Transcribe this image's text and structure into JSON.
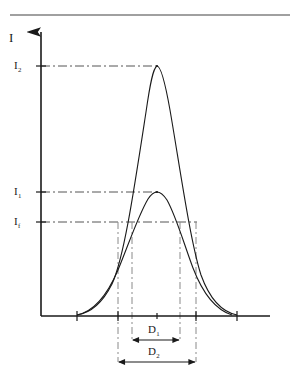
{
  "figure": {
    "background_color": "#ffffff",
    "ink_color": "#1a1a1a",
    "dash_color": "#555555",
    "top_rule": {
      "x1": 10,
      "x2": 290,
      "y": 15
    }
  },
  "axes": {
    "y_axis": {
      "label": "I",
      "x": 41,
      "y_top": 30,
      "y_bottom": 316,
      "arrow": "up-arrow"
    },
    "x_axis": {
      "label": "",
      "y": 316,
      "x_left": 41,
      "x_right": 270,
      "ticks_x": [
        77,
        118,
        157,
        196,
        237
      ]
    },
    "y_ticks": [
      {
        "label": "I",
        "sub": "2",
        "y": 66
      },
      {
        "label": "I",
        "sub": "1",
        "y": 192
      },
      {
        "label": "I",
        "sub": "f",
        "y": 222
      }
    ]
  },
  "reference_lines": {
    "horizontal": [
      {
        "name": "I2-level",
        "y": 66,
        "x1": 41,
        "x2": 157
      },
      {
        "name": "I1-level",
        "y": 192,
        "x1": 41,
        "x2": 157
      },
      {
        "name": "If-level",
        "y": 222,
        "x1": 41,
        "x2": 197
      }
    ],
    "vertical": [
      {
        "name": "D2-left",
        "x": 118,
        "y1": 222,
        "y2": 362
      },
      {
        "name": "D1-left",
        "x": 132,
        "y1": 222,
        "y2": 340
      },
      {
        "name": "D1-right",
        "x": 180,
        "y1": 222,
        "y2": 340
      },
      {
        "name": "D2-right",
        "x": 196,
        "y1": 222,
        "y2": 362
      }
    ]
  },
  "dimensions": [
    {
      "name": "D1",
      "label": "D",
      "sub": "1",
      "x1": 132,
      "x2": 180,
      "y": 340
    },
    {
      "name": "D2",
      "label": "D",
      "sub": "2",
      "x1": 118,
      "x2": 196,
      "y": 362
    }
  ],
  "chart_data": {
    "type": "line",
    "title": "",
    "xlabel": "",
    "ylabel": "I",
    "grid": false,
    "legend": null,
    "axis_pixel_frame": {
      "x0": 41,
      "x1": 270,
      "y_base": 316,
      "y_top": 30
    },
    "annotations": [
      {
        "text": "I",
        "sub": "2",
        "type": "y-tick",
        "value_y": 66
      },
      {
        "text": "I",
        "sub": "1",
        "type": "y-tick",
        "value_y": 192
      },
      {
        "text": "I",
        "sub": "f",
        "type": "y-tick",
        "value_y": 222
      },
      {
        "text": "D",
        "sub": "1",
        "type": "width-at-If-of-curve-1",
        "value_px": 48
      },
      {
        "text": "D",
        "sub": "2",
        "type": "width-at-If-of-curve-2",
        "value_px": 78
      }
    ],
    "series": [
      {
        "name": "curve-small-peak-I1",
        "peak_x": 157,
        "peak_y": 192,
        "width_at_If": 48,
        "path": "M 77,315 C 92,312 106,298 118,270 C 128,246 138,216 148,199 C 152,193 155,192 157,192 C 160,192 163,194 167,200 C 176,216 184,244 193,268 C 203,294 216,310 232,315"
      },
      {
        "name": "curve-large-peak-I2",
        "peak_x": 157,
        "peak_y": 66,
        "width_at_If": 78,
        "path": "M 77,315 C 90,313 102,304 112,284 C 124,258 134,190 146,112 C 150,84 153,68 157,66 C 161,66 165,82 170,110 C 180,168 190,240 201,275 C 210,300 222,312 237,315"
      }
    ]
  }
}
